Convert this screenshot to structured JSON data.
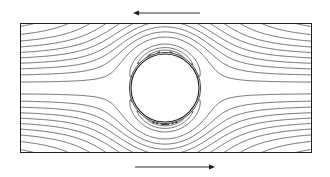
{
  "figure": {
    "kind": "streamline-plot",
    "title": "",
    "background_color": "#ffffff",
    "line_color": "#1a1a1a",
    "frame": {
      "x": 20,
      "y": 23,
      "width": 292,
      "height": 130,
      "border_color": "#222222",
      "border_width": 1
    },
    "cylinder": {
      "label": "circular cylinder",
      "center_x": 165,
      "center_y": 88,
      "radius": 34,
      "fill": "#ffffff",
      "stroke": "#1a1a1a",
      "stroke_width": 1.1
    },
    "vortices": [
      {
        "name": "left-recirculation-core",
        "center_x": 24,
        "center_y": 88
      },
      {
        "name": "right-recirculation-core",
        "center_x": 308,
        "center_y": 88
      }
    ],
    "arrows": [
      {
        "name": "top-wall-direction",
        "direction": "left",
        "x_start": 200,
        "x_end": 133,
        "y": 13,
        "color": "#1a1a1a"
      },
      {
        "name": "bottom-wall-direction",
        "direction": "right",
        "x_start": 135,
        "x_end": 215,
        "y": 167,
        "color": "#1a1a1a"
      }
    ],
    "streamlines": {
      "count_top_band": 26,
      "count_bottom_band": 26,
      "count_vortex_loops": 13,
      "description": "streamlines of viscous flow past a circular cylinder between moving walls"
    }
  }
}
